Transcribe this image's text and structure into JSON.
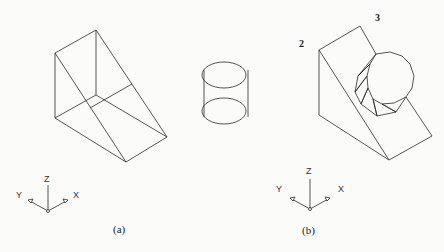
{
  "figure": {
    "panels": [
      {
        "id": "a",
        "caption": "(a)",
        "objects": [
          "wedge",
          "cylinder"
        ]
      },
      {
        "id": "b",
        "caption": "(b)",
        "objects": [
          "wedge-with-cylindrical-cut"
        ]
      }
    ],
    "annotations": {
      "label_2": "2",
      "label_3": "3"
    },
    "axes": {
      "z": "Z",
      "y": "Y",
      "x": "X"
    },
    "line_color": "#2a2a2a"
  }
}
